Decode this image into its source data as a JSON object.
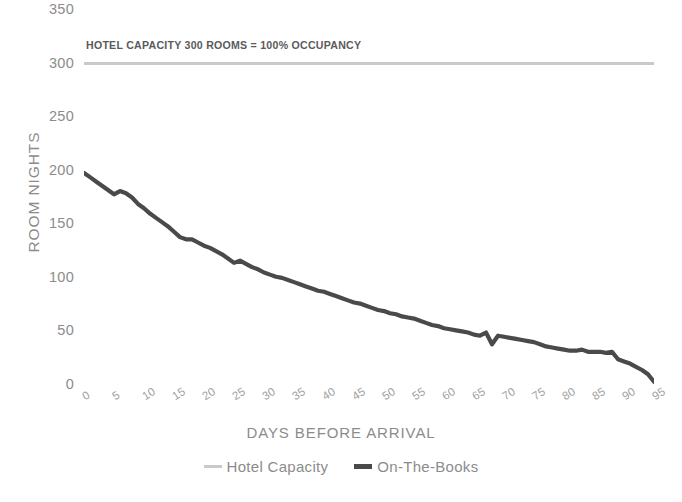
{
  "chart_data": {
    "type": "line",
    "title": "",
    "xlabel": "DAYS BEFORE ARRIVAL",
    "ylabel": "ROOM NIGHTS",
    "xlim": [
      0,
      95
    ],
    "ylim": [
      0,
      350
    ],
    "yticks": [
      0,
      50,
      100,
      150,
      200,
      250,
      300,
      350
    ],
    "xticks": [
      0,
      5,
      10,
      15,
      20,
      25,
      30,
      35,
      40,
      45,
      50,
      55,
      60,
      65,
      70,
      75,
      80,
      85,
      90,
      95
    ],
    "grid": false,
    "legend_position": "bottom",
    "annotations": [
      {
        "text": "HOTEL CAPACITY 300 ROOMS = 100% OCCUPANCY",
        "x": 2,
        "y": 318
      }
    ],
    "x": [
      0,
      1,
      2,
      3,
      4,
      5,
      6,
      7,
      8,
      9,
      10,
      11,
      12,
      13,
      14,
      15,
      16,
      17,
      18,
      19,
      20,
      21,
      22,
      23,
      24,
      25,
      26,
      27,
      28,
      29,
      30,
      31,
      32,
      33,
      34,
      35,
      36,
      37,
      38,
      39,
      40,
      41,
      42,
      43,
      44,
      45,
      46,
      47,
      48,
      49,
      50,
      51,
      52,
      53,
      54,
      55,
      56,
      57,
      58,
      59,
      60,
      61,
      62,
      63,
      64,
      65,
      66,
      67,
      68,
      69,
      70,
      71,
      72,
      73,
      74,
      75,
      76,
      77,
      78,
      79,
      80,
      81,
      82,
      83,
      84,
      85,
      86,
      87,
      88,
      89,
      90,
      91,
      92,
      93,
      94,
      95
    ],
    "series": [
      {
        "name": "Hotel Capacity",
        "color": "#c9c9c9",
        "values": [
          300,
          300,
          300,
          300,
          300,
          300,
          300,
          300,
          300,
          300,
          300,
          300,
          300,
          300,
          300,
          300,
          300,
          300,
          300,
          300,
          300,
          300,
          300,
          300,
          300,
          300,
          300,
          300,
          300,
          300,
          300,
          300,
          300,
          300,
          300,
          300,
          300,
          300,
          300,
          300,
          300,
          300,
          300,
          300,
          300,
          300,
          300,
          300,
          300,
          300,
          300,
          300,
          300,
          300,
          300,
          300,
          300,
          300,
          300,
          300,
          300,
          300,
          300,
          300,
          300,
          300,
          300,
          300,
          300,
          300,
          300,
          300,
          300,
          300,
          300,
          300,
          300,
          300,
          300,
          300,
          300,
          300,
          300,
          300,
          300,
          300,
          300,
          300,
          300,
          300,
          300,
          300,
          300,
          300,
          300,
          300
        ]
      },
      {
        "name": "On-The-Books",
        "color": "#4a4a4a",
        "values": [
          198,
          194,
          190,
          186,
          182,
          178,
          181,
          179,
          175,
          169,
          165,
          160,
          156,
          152,
          148,
          143,
          138,
          136,
          136,
          133,
          130,
          128,
          125,
          122,
          118,
          114,
          116,
          113,
          110,
          108,
          105,
          103,
          101,
          100,
          98,
          96,
          94,
          92,
          90,
          88,
          87,
          85,
          83,
          81,
          79,
          77,
          76,
          74,
          72,
          70,
          69,
          67,
          66,
          64,
          63,
          62,
          60,
          58,
          56,
          55,
          53,
          52,
          51,
          50,
          49,
          47,
          46,
          49,
          38,
          46,
          45,
          44,
          43,
          42,
          41,
          40,
          38,
          36,
          35,
          34,
          33,
          32,
          32,
          33,
          31,
          31,
          31,
          30,
          31,
          24,
          22,
          20,
          17,
          14,
          10,
          3
        ]
      }
    ]
  },
  "axis": {
    "ylabel": "ROOM NIGHTS",
    "xlabel": "DAYS BEFORE ARRIVAL",
    "ytick_labels": [
      "350",
      "300",
      "250",
      "200",
      "150",
      "100",
      "50",
      "0"
    ],
    "xtick_labels": [
      "0",
      "5",
      "10",
      "15",
      "20",
      "25",
      "30",
      "35",
      "40",
      "45",
      "50",
      "55",
      "60",
      "65",
      "70",
      "75",
      "80",
      "85",
      "90",
      "95"
    ]
  },
  "annotation": {
    "capacity_note": "HOTEL CAPACITY 300 ROOMS = 100% OCCUPANCY"
  },
  "legend": {
    "items": [
      {
        "label": "Hotel Capacity",
        "color": "#c9c9c9"
      },
      {
        "label": "On-The-Books",
        "color": "#4a4a4a"
      }
    ]
  },
  "colors": {
    "capacity_line": "#c9c9c9",
    "books_line": "#4a4a4a",
    "axis_text": "#8c8c8c",
    "background": "#ffffff"
  }
}
